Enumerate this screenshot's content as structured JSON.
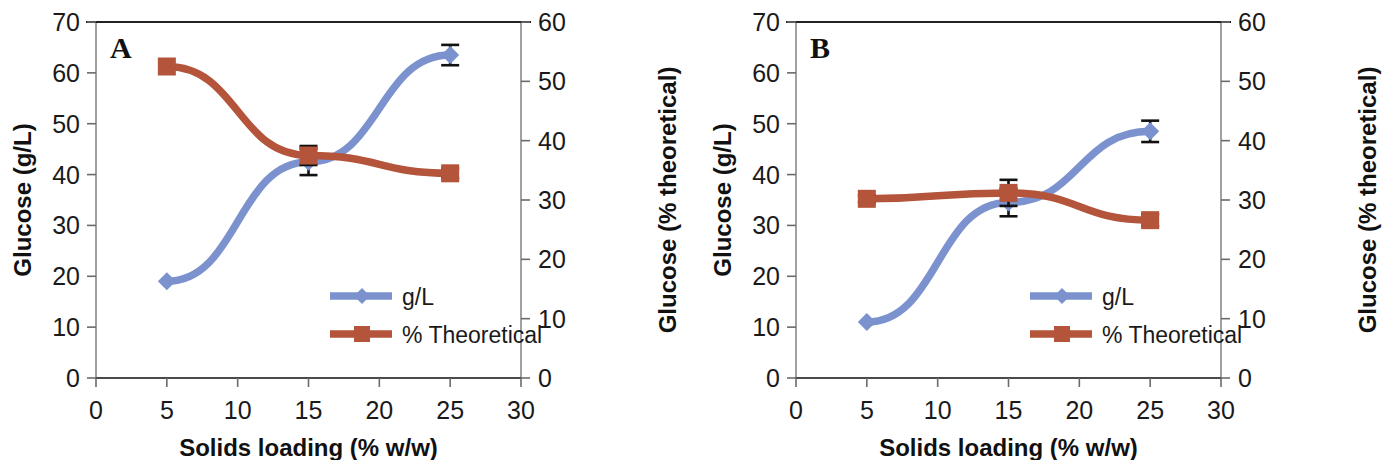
{
  "figure": {
    "panels": [
      "A",
      "B"
    ],
    "colors": {
      "series_gl": "#7b92ce",
      "series_theoretical": "#b4543a",
      "axis": "#6b6b6b",
      "text": "#1a1a1a",
      "frame": "#8a8a8a"
    }
  },
  "chart_data": [
    {
      "type": "line",
      "panel": "A",
      "title": "A",
      "xlabel": "Solids loading (% w/w)",
      "ylabel": "Glucose (g/L)",
      "y2label": "Glucose (% theoretical)",
      "x": [
        5,
        15,
        25
      ],
      "xlim": [
        0,
        30
      ],
      "xticks": [
        0,
        5,
        10,
        15,
        20,
        25,
        30
      ],
      "xtick_labels": [
        "0",
        "5",
        "10",
        "15",
        "20",
        "25",
        "30"
      ],
      "ylim": [
        0,
        70
      ],
      "yticks": [
        0,
        10,
        20,
        30,
        40,
        50,
        60,
        70
      ],
      "ytick_labels": [
        "0",
        "10",
        "20",
        "30",
        "40",
        "50",
        "60",
        "70"
      ],
      "y2lim": [
        0,
        60
      ],
      "y2ticks": [
        0,
        10,
        20,
        30,
        40,
        50,
        60
      ],
      "y2tick_labels": [
        "0",
        "10",
        "20",
        "30",
        "40",
        "50",
        "60"
      ],
      "grid": false,
      "legend_position": "lower center-right",
      "series": [
        {
          "name": "g/L",
          "axis": "left",
          "color": "#7b92ce",
          "marker": "diamond",
          "values": [
            19.0,
            42.5,
            63.5
          ],
          "errors": [
            0.0,
            2.6,
            2.0
          ]
        },
        {
          "name": "% Theoretical",
          "axis": "right",
          "color": "#b4543a",
          "marker": "square",
          "values": [
            52.5,
            37.5,
            34.5
          ],
          "errors": [
            0.0,
            1.6,
            0.8
          ]
        }
      ]
    },
    {
      "type": "line",
      "panel": "B",
      "title": "B",
      "xlabel": "Solids loading (% w/w)",
      "ylabel": "Glucose (g/L)",
      "y2label": "Glucose (% theoretical)",
      "x": [
        5,
        15,
        25
      ],
      "xlim": [
        0,
        30
      ],
      "xticks": [
        0,
        5,
        10,
        15,
        20,
        25,
        30
      ],
      "xtick_labels": [
        "0",
        "5",
        "10",
        "15",
        "20",
        "25",
        "30"
      ],
      "ylim": [
        0,
        70
      ],
      "yticks": [
        0,
        10,
        20,
        30,
        40,
        50,
        60,
        70
      ],
      "ytick_labels": [
        "0",
        "10",
        "20",
        "30",
        "40",
        "50",
        "60",
        "70"
      ],
      "y2lim": [
        0,
        60
      ],
      "y2ticks": [
        0,
        10,
        20,
        30,
        40,
        50,
        60
      ],
      "y2tick_labels": [
        "0",
        "10",
        "20",
        "30",
        "40",
        "50",
        "60"
      ],
      "grid": false,
      "legend_position": "lower center-right",
      "series": [
        {
          "name": "g/L",
          "axis": "left",
          "color": "#7b92ce",
          "marker": "diamond",
          "values": [
            11.0,
            34.5,
            48.5
          ],
          "errors": [
            0.0,
            2.7,
            2.1
          ]
        },
        {
          "name": "% Theoretical",
          "axis": "right",
          "color": "#b4543a",
          "marker": "square",
          "values": [
            30.2,
            31.2,
            26.6
          ],
          "errors": [
            0.6,
            2.2,
            1.0
          ]
        }
      ]
    }
  ]
}
